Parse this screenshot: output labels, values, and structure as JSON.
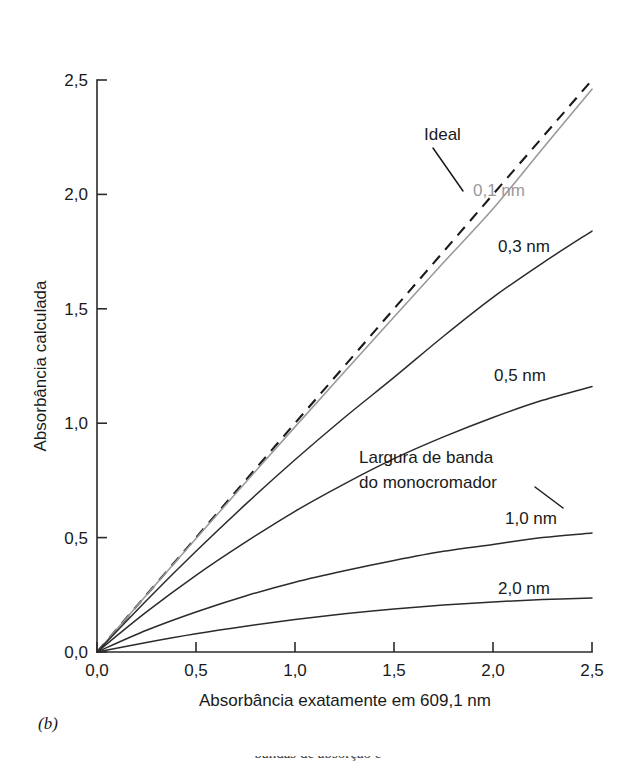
{
  "figure": {
    "panel_caption": "(b)",
    "bottom_cut_text": "bandas de absorção e"
  },
  "chart_data": {
    "type": "line",
    "title": "",
    "xlabel": "Absorbância exatamente em 609,1 nm",
    "ylabel": "Absorbância calculada",
    "xlim": [
      0,
      2.5
    ],
    "ylim": [
      0,
      2.5
    ],
    "grid": false,
    "legend_position": "inline-labels",
    "xticks": [
      "0,0",
      "0,5",
      "1,0",
      "1,5",
      "2,0",
      "2,5"
    ],
    "yticks": [
      "0,0",
      "0,5",
      "1,0",
      "1,5",
      "2,0",
      "2,5"
    ],
    "xtick_values": [
      0,
      0.5,
      1.0,
      1.5,
      2.0,
      2.5
    ],
    "ytick_values": [
      0,
      0.5,
      1.0,
      1.5,
      2.0,
      2.5
    ],
    "x": [
      0,
      0.25,
      0.5,
      0.75,
      1.0,
      1.25,
      1.5,
      1.75,
      2.0,
      2.25,
      2.5
    ],
    "series": [
      {
        "name": "Ideal",
        "label": "Ideal",
        "style": "dashed",
        "color": "#1a1a1a",
        "values": [
          0,
          0.25,
          0.5,
          0.75,
          1.0,
          1.25,
          1.5,
          1.75,
          2.0,
          2.25,
          2.5
        ]
      },
      {
        "name": "0,1 nm",
        "label": "0,1 nm",
        "style": "solid",
        "color": "#9a9a9a",
        "values": [
          0,
          0.249,
          0.496,
          0.741,
          0.984,
          1.225,
          1.464,
          1.702,
          1.937,
          2.2,
          2.46
        ]
      },
      {
        "name": "0,3 nm",
        "label": "0,3 nm",
        "style": "solid",
        "color": "#2b2b2b",
        "values": [
          0,
          0.225,
          0.44,
          0.645,
          0.84,
          1.025,
          1.2,
          1.38,
          1.55,
          1.7,
          1.84
        ]
      },
      {
        "name": "0,5 nm",
        "label": "0,5 nm",
        "style": "solid",
        "color": "#2b2b2b",
        "values": [
          0,
          0.175,
          0.335,
          0.48,
          0.615,
          0.735,
          0.845,
          0.94,
          1.025,
          1.1,
          1.16
        ]
      },
      {
        "name": "1,0 nm",
        "label": "1,0 nm",
        "style": "solid",
        "color": "#2b2b2b",
        "values": [
          0,
          0.095,
          0.175,
          0.245,
          0.305,
          0.355,
          0.4,
          0.44,
          0.47,
          0.5,
          0.52
        ]
      },
      {
        "name": "2,0 nm",
        "label": "2,0 nm",
        "style": "solid",
        "color": "#2b2b2b",
        "values": [
          0,
          0.042,
          0.08,
          0.113,
          0.142,
          0.167,
          0.188,
          0.205,
          0.219,
          0.229,
          0.236
        ]
      }
    ],
    "annotations": [
      {
        "name": "ideal-callout",
        "text": "Ideal",
        "target_series": "Ideal"
      },
      {
        "name": "bandwidth-callout",
        "text_line_1": "Largura de banda",
        "text_line_2": "do monocromador",
        "target_series": "1,0 nm"
      }
    ]
  }
}
